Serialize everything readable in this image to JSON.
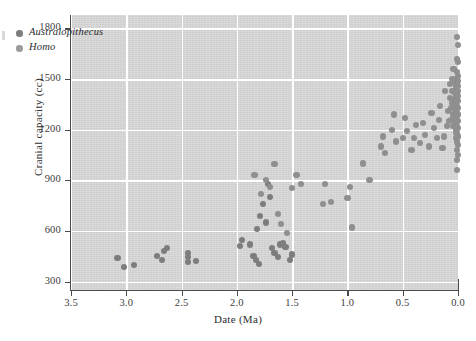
{
  "figure": {
    "background_color": "#ffffff",
    "panel_color": "#d8d8d8",
    "gridline_color": "#ffffff",
    "axis_color": "#4a4a4a"
  },
  "chart_data": {
    "type": "scatter",
    "title": "",
    "xlabel": "Date (Ma)",
    "ylabel": "Cranial capacity (cc)",
    "xlim": [
      3.5,
      0.0
    ],
    "ylim": [
      250,
      1880
    ],
    "x_inverted": true,
    "grid": true,
    "legend_position": "upper-left-inside",
    "xticks": [
      3.5,
      3.0,
      2.5,
      2.0,
      1.5,
      1.0,
      0.5,
      0.0
    ],
    "xticklabels": [
      "3.5",
      "3.0",
      "2.5",
      "2.0",
      "1.5",
      "1.0",
      "0.5",
      "0.0"
    ],
    "yticks": [
      300,
      600,
      900,
      1200,
      1500,
      1800
    ],
    "yticklabels": [
      "300",
      "600",
      "900",
      "1200",
      "1500",
      "1800"
    ],
    "marker_color": "#8a8a8a",
    "marker_size_px": 6.2,
    "series": [
      {
        "name": "Australopithecus",
        "color": "#7d7d7d",
        "points": [
          [
            3.08,
            440
          ],
          [
            3.02,
            385
          ],
          [
            2.93,
            400
          ],
          [
            2.68,
            430
          ],
          [
            2.72,
            450
          ],
          [
            2.63,
            500
          ],
          [
            2.66,
            480
          ],
          [
            2.44,
            415
          ],
          [
            2.44,
            445
          ],
          [
            2.44,
            470
          ],
          [
            2.37,
            420
          ],
          [
            1.97,
            510
          ],
          [
            1.95,
            545
          ],
          [
            1.88,
            520
          ],
          [
            1.85,
            450
          ],
          [
            1.83,
            430
          ],
          [
            1.8,
            405
          ],
          [
            1.82,
            610
          ],
          [
            1.79,
            690
          ],
          [
            1.76,
            760
          ],
          [
            1.74,
            650
          ],
          [
            1.72,
            880
          ],
          [
            1.7,
            800
          ],
          [
            1.68,
            500
          ],
          [
            1.66,
            470
          ],
          [
            1.63,
            445
          ],
          [
            1.61,
            520
          ],
          [
            1.58,
            530
          ],
          [
            1.56,
            505
          ],
          [
            1.52,
            430
          ],
          [
            1.5,
            460
          ]
        ]
      },
      {
        "name": "Homo",
        "color": "#8f8f8f",
        "points": [
          [
            1.84,
            930
          ],
          [
            1.78,
            820
          ],
          [
            1.74,
            900
          ],
          [
            1.7,
            860
          ],
          [
            1.66,
            995
          ],
          [
            1.63,
            700
          ],
          [
            1.6,
            640
          ],
          [
            1.55,
            590
          ],
          [
            1.5,
            855
          ],
          [
            1.46,
            930
          ],
          [
            1.42,
            880
          ],
          [
            1.22,
            760
          ],
          [
            1.2,
            880
          ],
          [
            1.15,
            770
          ],
          [
            1.0,
            795
          ],
          [
            0.98,
            860
          ],
          [
            0.96,
            620
          ],
          [
            0.86,
            1000
          ],
          [
            0.8,
            900
          ],
          [
            0.7,
            1100
          ],
          [
            0.68,
            1160
          ],
          [
            0.66,
            1060
          ],
          [
            0.6,
            1200
          ],
          [
            0.58,
            1290
          ],
          [
            0.56,
            1130
          ],
          [
            0.5,
            1150
          ],
          [
            0.48,
            1270
          ],
          [
            0.46,
            1190
          ],
          [
            0.42,
            1080
          ],
          [
            0.4,
            1150
          ],
          [
            0.38,
            1230
          ],
          [
            0.34,
            1120
          ],
          [
            0.32,
            1240
          ],
          [
            0.3,
            1170
          ],
          [
            0.26,
            1100
          ],
          [
            0.24,
            1300
          ],
          [
            0.22,
            1210
          ],
          [
            0.19,
            1150
          ],
          [
            0.17,
            1260
          ],
          [
            0.16,
            1340
          ],
          [
            0.14,
            1090
          ],
          [
            0.13,
            1160
          ],
          [
            0.12,
            1430
          ],
          [
            0.1,
            1220
          ],
          [
            0.09,
            1310
          ],
          [
            0.08,
            1250
          ],
          [
            0.07,
            1470
          ],
          [
            0.07,
            1390
          ],
          [
            0.06,
            1330
          ],
          [
            0.06,
            1260
          ],
          [
            0.05,
            1500
          ],
          [
            0.05,
            1430
          ],
          [
            0.05,
            1360
          ],
          [
            0.04,
            1290
          ],
          [
            0.04,
            1220
          ],
          [
            0.04,
            1560
          ],
          [
            0.03,
            1480
          ],
          [
            0.03,
            1420
          ],
          [
            0.03,
            1380
          ],
          [
            0.03,
            1340
          ],
          [
            0.03,
            1300
          ],
          [
            0.03,
            1250
          ],
          [
            0.02,
            1200
          ],
          [
            0.02,
            1150
          ],
          [
            0.02,
            1440
          ],
          [
            0.02,
            1400
          ],
          [
            0.02,
            1360
          ],
          [
            0.02,
            1320
          ],
          [
            0.02,
            1280
          ],
          [
            0.02,
            1240
          ],
          [
            0.015,
            1460
          ],
          [
            0.015,
            1410
          ],
          [
            0.015,
            1350
          ],
          [
            0.015,
            1290
          ],
          [
            0.015,
            1230
          ],
          [
            0.015,
            1180
          ],
          [
            0.01,
            1750
          ],
          [
            0.01,
            1620
          ],
          [
            0.01,
            1540
          ],
          [
            0.01,
            1500
          ],
          [
            0.01,
            1470
          ],
          [
            0.01,
            1440
          ],
          [
            0.01,
            1410
          ],
          [
            0.01,
            1380
          ],
          [
            0.01,
            1340
          ],
          [
            0.01,
            1300
          ],
          [
            0.01,
            1260
          ],
          [
            0.01,
            1220
          ],
          [
            0.01,
            1180
          ],
          [
            0.01,
            1130
          ],
          [
            0.01,
            1080
          ],
          [
            0.01,
            1020
          ],
          [
            0.01,
            960
          ],
          [
            0.0,
            1700
          ],
          [
            0.0,
            1600
          ],
          [
            0.0,
            1520
          ],
          [
            0.0,
            1490
          ],
          [
            0.0,
            1460
          ],
          [
            0.0,
            1430
          ],
          [
            0.0,
            1400
          ],
          [
            0.0,
            1370
          ],
          [
            0.0,
            1330
          ],
          [
            0.0,
            1290
          ],
          [
            0.0,
            1250
          ],
          [
            0.0,
            1210
          ],
          [
            0.0,
            1160
          ],
          [
            0.0,
            1110
          ],
          [
            0.0,
            1050
          ]
        ]
      }
    ]
  },
  "legend": {
    "items": [
      {
        "label": "Australopithecus",
        "color": "#7d7d7d"
      },
      {
        "label": "Homo",
        "color": "#9b9b9b"
      }
    ]
  }
}
